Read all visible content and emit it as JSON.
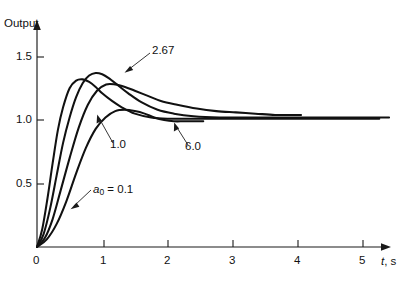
{
  "chart_data": {
    "type": "line",
    "title": "",
    "subtitle": "",
    "xlabel": "t, s",
    "ylabel": "Output",
    "xlim": [
      0,
      5.5
    ],
    "ylim": [
      0,
      1.75
    ],
    "grid": false,
    "legend_position": "inline-annotations",
    "x_ticks": [
      0,
      1,
      2,
      3,
      4,
      5
    ],
    "x_tick_labels": [
      "0",
      "1",
      "2",
      "3",
      "4",
      "5"
    ],
    "y_ticks": [
      0.5,
      1.0,
      1.5
    ],
    "y_tick_labels": [
      "0.5",
      "1.0",
      "1.5"
    ],
    "series_parameter_name": "a_0",
    "annotations": [
      {
        "text": "2.67",
        "series": "2.67",
        "points_to": "peak of a0=2.67 curve"
      },
      {
        "text": "1.0",
        "series": "1.0",
        "points_to": "rising edge of a0=1.0 curve"
      },
      {
        "text": "6.0",
        "series": "6.0",
        "points_to": "settling tail of a0=6.0 curve"
      },
      {
        "text": "a_0 = 0.1",
        "series": "0.1",
        "points_to": "rising edge of a0=0.1 curve"
      }
    ],
    "series": [
      {
        "name": "0.1",
        "label": "a_0 = 0.1",
        "x": [
          0.0,
          0.08,
          0.16,
          0.24,
          0.32,
          0.4,
          0.5,
          0.6,
          0.7,
          0.8,
          0.9,
          1.0,
          1.15,
          1.3,
          1.5,
          1.75,
          2.0,
          2.3,
          2.6,
          3.0,
          3.4,
          3.8,
          4.2,
          4.6,
          5.0,
          5.25
        ],
        "y": [
          0.0,
          0.14,
          0.38,
          0.66,
          0.92,
          1.1,
          1.25,
          1.31,
          1.32,
          1.3,
          1.26,
          1.21,
          1.15,
          1.1,
          1.05,
          1.02,
          1.01,
          1.01,
          1.01,
          1.01,
          1.01,
          1.01,
          1.01,
          1.01,
          1.01,
          1.01
        ]
      },
      {
        "name": "1.0",
        "label": "1.0",
        "x": [
          0.0,
          0.1,
          0.2,
          0.3,
          0.4,
          0.5,
          0.6,
          0.7,
          0.8,
          0.9,
          1.0,
          1.1,
          1.25,
          1.4,
          1.6,
          1.85,
          2.1,
          2.4,
          2.8,
          3.2,
          3.6,
          4.0,
          4.4,
          4.8,
          5.2,
          5.4
        ],
        "y": [
          0.0,
          0.1,
          0.3,
          0.56,
          0.82,
          1.02,
          1.18,
          1.29,
          1.35,
          1.37,
          1.36,
          1.33,
          1.27,
          1.21,
          1.14,
          1.08,
          1.05,
          1.03,
          1.02,
          1.02,
          1.02,
          1.02,
          1.02,
          1.02,
          1.02,
          1.02
        ]
      },
      {
        "name": "2.67",
        "label": "2.67",
        "x": [
          0.0,
          0.12,
          0.24,
          0.36,
          0.5,
          0.64,
          0.78,
          0.92,
          1.06,
          1.2,
          1.35,
          1.5,
          1.7,
          1.9,
          2.15,
          2.45,
          2.75,
          3.05,
          3.35,
          3.65,
          3.9,
          4.05
        ],
        "y": [
          0.0,
          0.07,
          0.22,
          0.44,
          0.7,
          0.94,
          1.12,
          1.23,
          1.28,
          1.28,
          1.26,
          1.23,
          1.19,
          1.15,
          1.12,
          1.09,
          1.07,
          1.06,
          1.05,
          1.04,
          1.04,
          1.04
        ]
      },
      {
        "name": "6.0",
        "label": "6.0",
        "x": [
          0.0,
          0.15,
          0.3,
          0.45,
          0.6,
          0.75,
          0.9,
          1.05,
          1.2,
          1.35,
          1.5,
          1.65,
          1.8,
          1.95,
          2.1,
          2.25,
          2.4,
          2.55
        ],
        "y": [
          0.0,
          0.06,
          0.18,
          0.36,
          0.58,
          0.78,
          0.93,
          1.02,
          1.07,
          1.08,
          1.07,
          1.05,
          1.02,
          1.0,
          0.99,
          0.99,
          0.99,
          0.99
        ]
      }
    ]
  },
  "axes": {
    "y_title": "Output",
    "x_title_var": "t",
    "x_title_unit": ", s"
  },
  "labels": {
    "y_1_5": "1.5",
    "y_1_0": "1.0",
    "y_0_5": "0.5",
    "x_0": "0",
    "x_1": "1",
    "x_2": "2",
    "x_3": "3",
    "x_4": "4",
    "x_5": "5",
    "annot_267": "2.67",
    "annot_10": "1.0",
    "annot_60": "6.0",
    "annot_a0_var": "a",
    "annot_a0_sub": "0",
    "annot_a0_rest": " = 0.1"
  },
  "colors": {
    "curve": "#111111",
    "axis": "#1a1a1a",
    "leader": "#2b2b2b",
    "background": "#ffffff"
  }
}
